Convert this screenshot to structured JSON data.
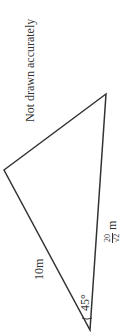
{
  "diagram": {
    "note": "Not drawn accurately",
    "triangle": {
      "vertices": {
        "left": [
          4,
          170
        ],
        "top_right": [
          106,
          94
        ],
        "bottom": [
          90,
          330
        ]
      },
      "stroke_color": "#333333"
    },
    "labels": {
      "side_left": "10m",
      "side_right_numerator": "20",
      "side_right_denominator": "√2",
      "side_right_unit": "m",
      "angle": "45°"
    }
  }
}
